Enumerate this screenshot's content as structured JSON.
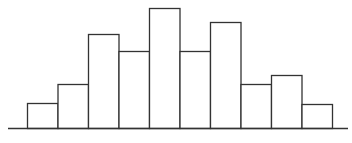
{
  "chart_data": {
    "type": "bar",
    "title": "",
    "xlabel": "",
    "ylabel": "",
    "categories": [
      "1",
      "2",
      "3",
      "4",
      "5",
      "6",
      "7",
      "8",
      "9",
      "10"
    ],
    "values": [
      25,
      44,
      94,
      77,
      120,
      77,
      106,
      44,
      53,
      24
    ],
    "ylim": [
      0,
      120
    ],
    "grid": false,
    "legend": null,
    "style": {
      "bar_fill": "#ffffff",
      "bar_stroke": "#333333",
      "axis_color": "#333333",
      "bar_gap": 0
    }
  }
}
